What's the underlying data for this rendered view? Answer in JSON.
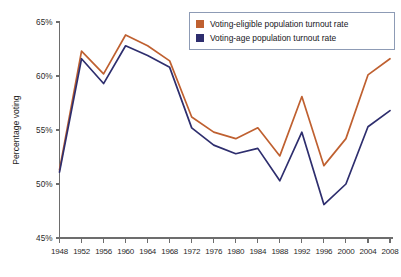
{
  "chart_data": {
    "type": "line",
    "title": "",
    "xlabel": "",
    "ylabel": "Percentage voting",
    "ylim": [
      45,
      65
    ],
    "ytick_values": [
      45,
      50,
      55,
      60,
      65
    ],
    "ytick_labels": [
      "45%",
      "50%",
      "55%",
      "60%",
      "65%"
    ],
    "grid": false,
    "legend_position": "top-right",
    "categories": [
      1948,
      1952,
      1956,
      1960,
      1964,
      1968,
      1972,
      1976,
      1980,
      1984,
      1988,
      1992,
      1996,
      2000,
      2004,
      2008
    ],
    "xtick_labels": [
      "1948",
      "1952",
      "1956",
      "1960",
      "1964",
      "1968",
      "1972",
      "1976",
      "1980",
      "1984",
      "1988",
      "1992",
      "1996",
      "2000",
      "2004",
      "2008"
    ],
    "series": [
      {
        "name": "Voting-eligible population turnout rate",
        "color": "#bf6030",
        "values": [
          51.3,
          62.3,
          60.2,
          63.8,
          62.8,
          61.4,
          56.2,
          54.8,
          54.2,
          55.2,
          52.6,
          58.1,
          51.7,
          54.2,
          60.1,
          61.6
        ]
      },
      {
        "name": "Voting-age population turnout rate",
        "color": "#2e2e6e",
        "values": [
          51.1,
          61.6,
          59.3,
          62.8,
          61.9,
          60.8,
          55.2,
          53.6,
          52.8,
          53.3,
          50.3,
          54.8,
          48.1,
          50.0,
          55.3,
          56.8
        ]
      }
    ]
  },
  "legend": {
    "items": [
      {
        "label": "Voting-eligible population turnout rate",
        "color": "#bf6030"
      },
      {
        "label": "Voting-age population turnout rate",
        "color": "#2e2e6e"
      }
    ]
  },
  "axes": {
    "y_axis_title": "Percentage voting"
  }
}
